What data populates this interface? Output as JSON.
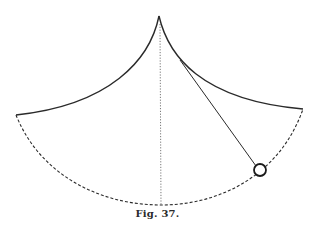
{
  "figure": {
    "caption": "Fig. 37.",
    "colors": {
      "ink": "#2a2a2a",
      "background": "#ffffff"
    },
    "elements": {
      "apex": [
        159,
        16
      ],
      "left_tip": [
        16,
        115
      ],
      "right_tip": [
        303,
        109
      ],
      "path_bottom": [
        161,
        205
      ],
      "cord_tangent_point": [
        180,
        60
      ],
      "bob_center": [
        260,
        170
      ],
      "bob_radius": 6
    }
  }
}
